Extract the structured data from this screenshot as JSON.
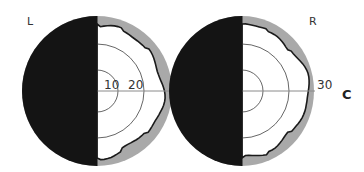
{
  "figure": {
    "panel_label": "C",
    "colors": {
      "background": "#ffffff",
      "scotoma": "#141414",
      "ring": "#a9a9a9",
      "field_white": "#ffffff",
      "isopter_line": "#1a1a1a",
      "grid_line": "#555555",
      "axis_line": "#8a8a8a"
    },
    "eyes": [
      {
        "id": "left",
        "label": "L",
        "center": [
          97,
          91
        ],
        "outer_radius": 75,
        "dark_half": "left",
        "ring_labels": [
          "10",
          "20"
        ],
        "ring_label_positions": [
          [
            104,
            89
          ],
          [
            128,
            89
          ]
        ]
      },
      {
        "id": "right",
        "label": "R",
        "center": [
          242,
          91
        ],
        "outer_radius": 73,
        "dark_half": "left",
        "ring_labels": [
          "30"
        ],
        "ring_label_positions": [
          [
            317,
            89
          ]
        ]
      }
    ],
    "grid_rings_degrees": [
      10,
      20,
      30
    ],
    "eye_label_positions": {
      "L": [
        27,
        25
      ],
      "R": [
        309,
        25
      ]
    },
    "panel_label_position": [
      342,
      99
    ]
  }
}
